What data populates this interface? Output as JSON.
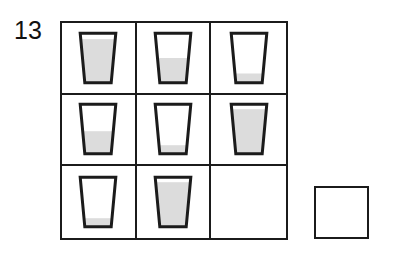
{
  "item": {
    "number": "13",
    "type": "matrix-reasoning-puzzle"
  },
  "colors": {
    "outline": "#1b1b1b",
    "liquid": "#dcdcdc",
    "glass_empty": "#ffffff",
    "background": "#ffffff"
  },
  "matrix": {
    "rows": 3,
    "columns": 3,
    "cells": [
      {
        "position": "row1-col1",
        "shape": "glass",
        "fill_level": 0.88,
        "fill_label": "nearly full",
        "empty": false
      },
      {
        "position": "row1-col2",
        "shape": "glass",
        "fill_level": 0.5,
        "fill_label": "half full",
        "empty": false
      },
      {
        "position": "row1-col3",
        "shape": "glass",
        "fill_level": 0.18,
        "fill_label": "nearly empty",
        "empty": false
      },
      {
        "position": "row2-col1",
        "shape": "glass",
        "fill_level": 0.46,
        "fill_label": "half full",
        "empty": false
      },
      {
        "position": "row2-col2",
        "shape": "glass",
        "fill_level": 0.17,
        "fill_label": "nearly empty",
        "empty": false
      },
      {
        "position": "row2-col3",
        "shape": "glass",
        "fill_level": 0.9,
        "fill_label": "nearly full",
        "empty": false
      },
      {
        "position": "row3-col1",
        "shape": "glass",
        "fill_level": 0.17,
        "fill_label": "nearly empty",
        "empty": false
      },
      {
        "position": "row3-col2",
        "shape": "glass",
        "fill_level": 0.9,
        "fill_label": "nearly full",
        "empty": false
      },
      {
        "position": "row3-col3",
        "shape": "none",
        "fill_level": 0,
        "fill_label": "missing",
        "empty": true
      }
    ]
  },
  "answer_box": {
    "label": "",
    "empty": true
  }
}
